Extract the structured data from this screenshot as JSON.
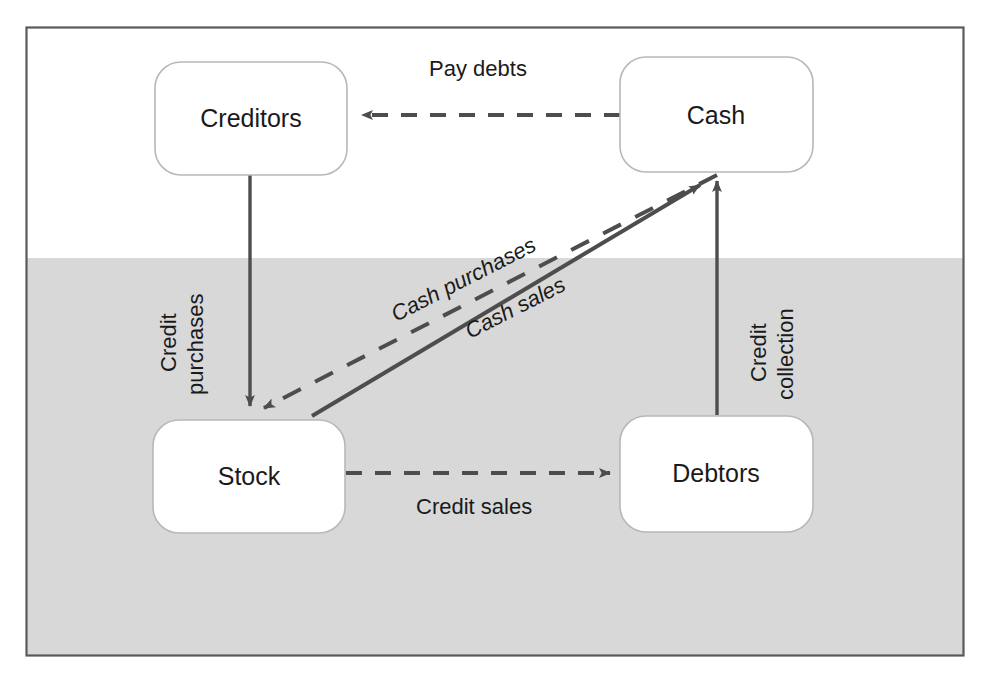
{
  "diagram": {
    "frame": {
      "border_color": "#5a5a5a",
      "background_color": "#ffffff",
      "shaded_region_color": "#d8d8d8"
    },
    "node_fill": "#ffffff",
    "node_stroke": "#b8b8b8",
    "line_color": "#4d4d4d",
    "nodes": [
      {
        "id": "creditors",
        "label": "Creditors",
        "x": 155,
        "y": 62,
        "w": 192,
        "h": 113
      },
      {
        "id": "cash",
        "label": "Cash",
        "x": 620,
        "y": 57,
        "w": 193,
        "h": 115
      },
      {
        "id": "stock",
        "label": "Stock",
        "x": 153,
        "y": 420,
        "w": 192,
        "h": 113
      },
      {
        "id": "debtors",
        "label": "Debtors",
        "x": 620,
        "y": 416,
        "w": 193,
        "h": 116
      }
    ],
    "edges": [
      {
        "id": "pay-debts",
        "label": "Pay debts",
        "from": "cash",
        "to": "creditors",
        "style": "dashed",
        "orientation": "horizontal",
        "label_x": 478,
        "label_y": 76,
        "label_rotation": 0,
        "label_italic": false
      },
      {
        "id": "credit-purchases",
        "label": "Credit\npurchases",
        "label_line1": "Credit",
        "label_line2": "purchases",
        "from": "creditors",
        "to": "stock",
        "style": "solid",
        "orientation": "vertical",
        "label_x": 176,
        "label_y": 372,
        "label_rotation": -90,
        "label_italic": false
      },
      {
        "id": "cash-purchases",
        "label": "Cash purchases",
        "from": "cash",
        "to": "stock",
        "style": "dashed",
        "orientation": "diagonal",
        "label_x": 396,
        "label_y": 322,
        "label_rotation": -27,
        "label_italic": true
      },
      {
        "id": "cash-sales",
        "label": "Cash sales",
        "from": "stock",
        "to": "cash",
        "style": "solid",
        "orientation": "diagonal",
        "label_x": 470,
        "label_y": 339,
        "label_rotation": -27,
        "label_italic": true
      },
      {
        "id": "credit-sales",
        "label": "Credit sales",
        "from": "stock",
        "to": "debtors",
        "style": "dashed",
        "orientation": "horizontal",
        "label_x": 416,
        "label_y": 514,
        "label_rotation": 0,
        "label_italic": false
      },
      {
        "id": "credit-collection",
        "label": "Credit\ncollection",
        "label_line1": "Credit",
        "label_line2": "collection",
        "from": "debtors",
        "to": "cash",
        "style": "solid",
        "orientation": "vertical",
        "label_x": 766,
        "label_y": 382,
        "label_rotation": -90,
        "label_italic": false
      }
    ]
  }
}
